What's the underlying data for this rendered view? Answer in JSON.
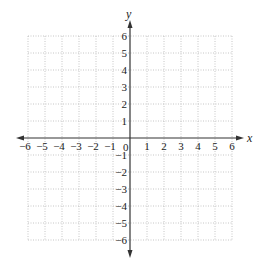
{
  "chart_data": {
    "type": "scatter",
    "title": "",
    "xlabel": "x",
    "ylabel": "y",
    "xlim": [
      -6,
      6
    ],
    "ylim": [
      -6,
      6
    ],
    "grid": true,
    "grid_style": "dotted",
    "x_ticks": [
      "−6",
      "−5",
      "−4",
      "−3",
      "−2",
      "−1",
      "1",
      "2",
      "3",
      "4",
      "5",
      "6"
    ],
    "y_ticks": [
      "6",
      "5",
      "4",
      "3",
      "2",
      "1",
      "−1",
      "−2",
      "−3",
      "−4",
      "−5",
      "−6"
    ],
    "origin_label": "0",
    "series": [],
    "colors": {
      "axis": "#333333",
      "grid": "#b8b8b8",
      "text": "#222222"
    }
  },
  "labels": {
    "x_axis": "x",
    "y_axis": "y",
    "origin": "0"
  }
}
